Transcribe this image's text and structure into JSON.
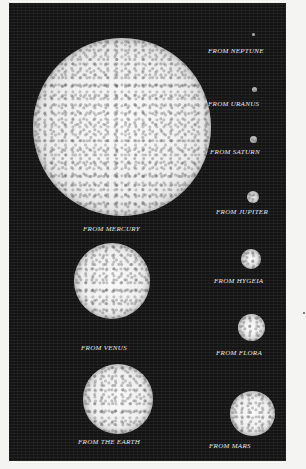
{
  "figure": {
    "colors": {
      "plate": "#141414",
      "sun": "#f2f2f2",
      "paper": "#f4f4f2",
      "label": "#e6e6e6"
    },
    "views": [
      {
        "id": "neptune",
        "label": "From Neptune",
        "cx": 189,
        "cy": 37,
        "d": 3
      },
      {
        "id": "uranus",
        "label": "From Uranus",
        "cx": 191,
        "cy": 86,
        "d": 5
      },
      {
        "id": "saturn",
        "label": "From Saturn",
        "cx": 253,
        "cy": 137,
        "d": 8
      },
      {
        "id": "mercury",
        "label": "From Mercury",
        "cx": 118,
        "cy": 124,
        "d": 180
      },
      {
        "id": "jupiter",
        "label": "From Jupiter",
        "cx": 252,
        "cy": 195,
        "d": 13
      },
      {
        "id": "hygeia",
        "label": "From Hygeia",
        "cx": 252,
        "cy": 255,
        "d": 20
      },
      {
        "id": "venus",
        "label": "From Venus",
        "cx": 112,
        "cy": 290,
        "d": 76
      },
      {
        "id": "flora",
        "label": "From Flora",
        "cx": 252,
        "cy": 327,
        "d": 27
      },
      {
        "id": "earth",
        "label": "From the Earth",
        "cx": 118,
        "cy": 398,
        "d": 70
      },
      {
        "id": "mars",
        "label": "From Mars",
        "cx": 252,
        "cy": 409,
        "d": 45
      }
    ]
  }
}
